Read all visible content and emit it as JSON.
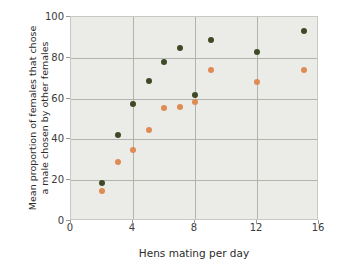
{
  "chart_data": {
    "type": "scatter",
    "title": "",
    "xlabel": "Hens mating per day",
    "ylabel": "Mean proportion of females that chose a male chosen by other females",
    "ylabel_lines": [
      "Mean proportion of females that chose",
      "a male chosen by other females"
    ],
    "xlim": [
      0,
      16
    ],
    "ylim": [
      0,
      100
    ],
    "xticks": [
      0,
      4,
      8,
      12,
      16
    ],
    "yticks": [
      0,
      20,
      40,
      60,
      80,
      100
    ],
    "xtick_labels": [
      "0",
      "4",
      "8",
      "12",
      "16"
    ],
    "ytick_labels": [
      "0",
      "20",
      "40",
      "60",
      "80",
      "100"
    ],
    "grid": true,
    "legend": "none",
    "plot_background": "#ebebe8",
    "gridline_color": "#b3b3ad",
    "series": [
      {
        "name": "dark-green-series",
        "color": "#3e4a27",
        "marker": "circle",
        "points": [
          {
            "x": 2,
            "y": 18.5
          },
          {
            "x": 3,
            "y": 42
          },
          {
            "x": 4,
            "y": 57.5
          },
          {
            "x": 5,
            "y": 68.5
          },
          {
            "x": 6,
            "y": 78
          },
          {
            "x": 7,
            "y": 85
          },
          {
            "x": 8,
            "y": 62
          },
          {
            "x": 9,
            "y": 88.5
          },
          {
            "x": 12,
            "y": 83
          },
          {
            "x": 15,
            "y": 93
          }
        ]
      },
      {
        "name": "orange-series",
        "color": "#e08b53",
        "marker": "circle",
        "points": [
          {
            "x": 2,
            "y": 14.5
          },
          {
            "x": 3,
            "y": 29
          },
          {
            "x": 4,
            "y": 35
          },
          {
            "x": 5,
            "y": 44.5
          },
          {
            "x": 6,
            "y": 55.5
          },
          {
            "x": 7,
            "y": 56
          },
          {
            "x": 8,
            "y": 58.5
          },
          {
            "x": 9,
            "y": 74
          },
          {
            "x": 12,
            "y": 68
          },
          {
            "x": 15,
            "y": 74
          }
        ]
      }
    ]
  }
}
